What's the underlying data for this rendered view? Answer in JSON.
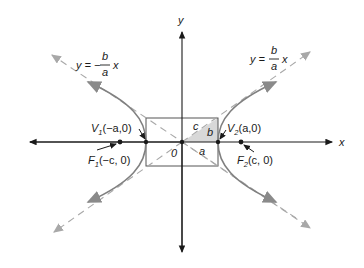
{
  "diagram": {
    "axes": {
      "x_label": "x",
      "y_label": "y",
      "origin_label": "0"
    },
    "asymptotes": {
      "negative": {
        "lhs": "y = −",
        "num": "b",
        "den": "a",
        "var": "x"
      },
      "positive": {
        "lhs": "y =",
        "num": "b",
        "den": "a",
        "var": "x"
      }
    },
    "points": {
      "V1": {
        "name": "V",
        "sub": "1",
        "coords": "(−a,0)"
      },
      "V2": {
        "name": "V",
        "sub": "2",
        "coords": "(a,0)"
      },
      "F1": {
        "name": "F",
        "sub": "1",
        "coords": "(−c, 0)"
      },
      "F2": {
        "name": "F",
        "sub": "2",
        "coords": "(c, 0)"
      }
    },
    "triangle_labels": {
      "a": "a",
      "b": "b",
      "c": "c"
    },
    "colors": {
      "axis": "#1a1a1a",
      "curve": "#808080",
      "asymptote": "#a0a0a0",
      "shade": "#d8d8d8",
      "box": "#555555"
    }
  }
}
